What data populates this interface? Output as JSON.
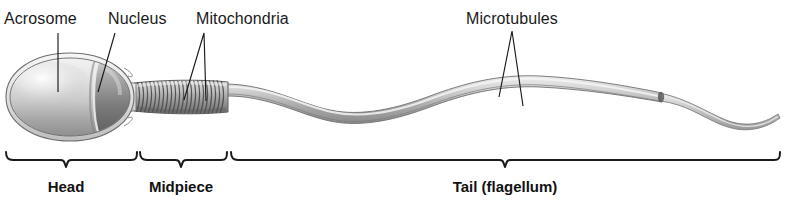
{
  "figure": {
    "style": "grayscale pencil/airbrush scientific illustration",
    "background_color": "#ffffff",
    "ink_color": "#1a1a1a"
  },
  "callouts": [
    {
      "id": "acrosome",
      "label": "Acrosome",
      "label_x": 4,
      "label_y": 10,
      "leader": {
        "type": "line",
        "points": [
          [
            58,
            33
          ],
          [
            58,
            92
          ]
        ]
      }
    },
    {
      "id": "nucleus",
      "label": "Nucleus",
      "label_x": 108,
      "label_y": 10,
      "leader": {
        "type": "line",
        "points": [
          [
            115,
            33
          ],
          [
            98,
            92
          ]
        ]
      }
    },
    {
      "id": "mitochondria",
      "label": "Mitochondria",
      "label_x": 196,
      "label_y": 10,
      "leader": {
        "type": "vee",
        "points": [
          [
            184,
            100
          ],
          [
            204,
            33
          ],
          [
            206,
            101
          ]
        ]
      }
    },
    {
      "id": "microtubules",
      "label": "Microtubules",
      "label_x": 466,
      "label_y": 10,
      "leader": {
        "type": "vee",
        "points": [
          [
            499,
            97
          ],
          [
            512,
            31
          ],
          [
            523,
            106
          ]
        ]
      }
    }
  ],
  "brackets": [
    {
      "id": "head",
      "label": "Head",
      "x_start": 5,
      "x_end": 137,
      "notch_x": 66,
      "label_center_x": 66,
      "label_y": 178
    },
    {
      "id": "midpiece",
      "label": "Midpiece",
      "x_start": 139,
      "x_end": 228,
      "notch_x": 181,
      "label_center_x": 181,
      "label_y": 178
    },
    {
      "id": "tail",
      "label": "Tail (flagellum)",
      "x_start": 230,
      "x_end": 781,
      "notch_x": 505,
      "label_center_x": 505,
      "label_y": 178
    }
  ],
  "anatomy": {
    "head": {
      "name": "head",
      "center_x": 70,
      "center_y": 97,
      "radius_x": 62,
      "radius_y": 41,
      "parts": [
        "acrosome-cap",
        "nucleus",
        "plasma-membrane"
      ]
    },
    "acrosome": {
      "name": "acrosome",
      "shade": "#d8d8d8"
    },
    "nucleus": {
      "name": "nucleus",
      "shade": "#8d8d8d"
    },
    "neck": {
      "name": "connecting-piece",
      "x": 126,
      "y": 97
    },
    "midpiece": {
      "name": "midpiece",
      "x_start": 136,
      "x_end": 226,
      "coil_count": 21,
      "shade": "#9b9b9b"
    },
    "tail": {
      "name": "flagellum",
      "x_start": 226,
      "x_end": 780,
      "wave_peaks_y": [
        75,
        118
      ],
      "end_piece_x": 660,
      "shade": "#b9b9b9"
    }
  }
}
